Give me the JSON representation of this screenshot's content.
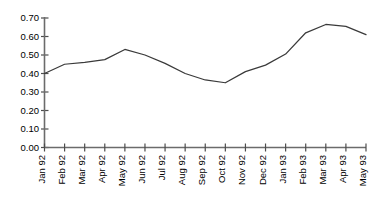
{
  "chart_data": {
    "type": "line",
    "title": "",
    "subtitle": "",
    "xlabel": "",
    "ylabel": "",
    "grid": false,
    "legend": false,
    "ylim": [
      0.0,
      0.7
    ],
    "ytick_labels": [
      "0.70",
      "0.60",
      "0.50",
      "0.40",
      "0.30",
      "0.20",
      "0.10",
      "0.00"
    ],
    "ytick_values": [
      0.7,
      0.6,
      0.5,
      0.4,
      0.3,
      0.2,
      0.1,
      0.0
    ],
    "categories": [
      "Jan 92",
      "Feb 92",
      "Mar 92",
      "Apr 92",
      "May 92",
      "Jun 92",
      "Jul 92",
      "Aug 92",
      "Sep 92",
      "Oct 92",
      "Nov 92",
      "Dec 92",
      "Jan 93",
      "Feb 93",
      "Mar 93",
      "Apr 93",
      "May 93"
    ],
    "series": [
      {
        "name": "series-1",
        "values": [
          0.4,
          0.45,
          0.46,
          0.475,
          0.53,
          0.5,
          0.455,
          0.4,
          0.365,
          0.35,
          0.41,
          0.445,
          0.505,
          0.62,
          0.665,
          0.655,
          0.61
        ]
      }
    ]
  }
}
